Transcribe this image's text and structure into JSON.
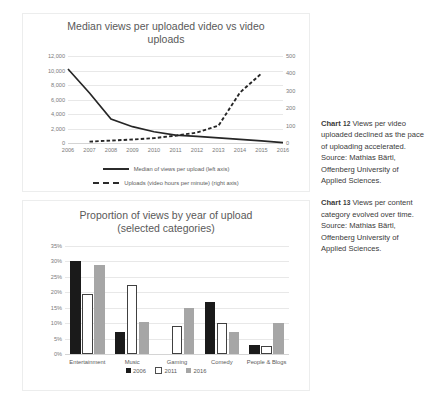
{
  "chart_data": [
    {
      "type": "line",
      "title": "Median views per uploaded video vs video uploads",
      "xlabel": "",
      "ylabel": "",
      "x": [
        2006,
        2007,
        2008,
        2009,
        2010,
        2011,
        2012,
        2013,
        2014,
        2015,
        2016
      ],
      "xticks": [
        "2006",
        "2007",
        "2008",
        "2009",
        "2010",
        "2011",
        "2012",
        "2013",
        "2014",
        "2015",
        "2016"
      ],
      "left_axis": {
        "ticks": [
          "0",
          "2,000",
          "4,000",
          "6,000",
          "8,000",
          "10,000",
          "12,000"
        ],
        "values": [
          0,
          2000,
          4000,
          6000,
          8000,
          10000,
          12000
        ],
        "ylim": [
          0,
          12000
        ]
      },
      "right_axis": {
        "ticks": [
          "0",
          "100",
          "200",
          "300",
          "400",
          "500"
        ],
        "values": [
          0,
          100,
          200,
          300,
          400,
          500
        ],
        "ylim": [
          0,
          500
        ]
      },
      "grid": true,
      "legend_position": "bottom",
      "series": [
        {
          "name": "Median of views per upload (left axis)",
          "style": "solid",
          "axis": "left",
          "values": [
            10200,
            6900,
            3300,
            2250,
            1550,
            1100,
            900,
            700,
            500,
            300,
            60
          ]
        },
        {
          "name": "Uploads (video hours per minute) (right axis)",
          "style": "dashed",
          "axis": "right",
          "values": [
            null,
            8,
            14,
            20,
            28,
            42,
            60,
            100,
            290,
            400,
            null
          ]
        }
      ]
    },
    {
      "type": "bar",
      "title": "Proportion of views by year of upload (selected categories)",
      "xlabel": "",
      "ylabel": "",
      "categories": [
        "Entertainment",
        "Music",
        "Gaming",
        "Comedy",
        "People & Blogs"
      ],
      "yticks": [
        "0%",
        "5%",
        "10%",
        "15%",
        "20%",
        "25%",
        "30%",
        "35%"
      ],
      "ylim": [
        0,
        35
      ],
      "grid": true,
      "legend_position": "bottom",
      "series": [
        {
          "name": "2006",
          "color": "#1a1a1a",
          "values": [
            30.0,
            7.0,
            0,
            17.0,
            3.0
          ]
        },
        {
          "name": "2011",
          "color": "#ffffff",
          "values": [
            19.5,
            22.5,
            9.0,
            10.0,
            2.5
          ]
        },
        {
          "name": "2016",
          "color": "#a6a6a6",
          "values": [
            29.0,
            10.5,
            15.0,
            7.0,
            10.0
          ]
        }
      ]
    }
  ],
  "chart1": {
    "title_line1": "Median views per uploaded video vs video",
    "title_line2": "uploads",
    "legend_solid": "Median of views per upload (left axis)",
    "legend_dashed": "Uploads (video hours per minute) (right axis)"
  },
  "chart2": {
    "title_line1": "Proportion of views by year of upload",
    "title_line2": "(selected categories)",
    "legend": [
      "2006",
      "2011",
      "2016"
    ]
  },
  "captions": [
    {
      "label": "Chart",
      "number": "12",
      "text": "Views per video uploaded declined as the pace of uploading accelerated. Source: Mathias Bärtl, Offenberg University of Applied Sciences."
    },
    {
      "label": "Chart",
      "number": "13",
      "text": "Views per content category evolved over time. Source: Mathias Bärtl, Offenberg University of Applied Sciences."
    }
  ]
}
